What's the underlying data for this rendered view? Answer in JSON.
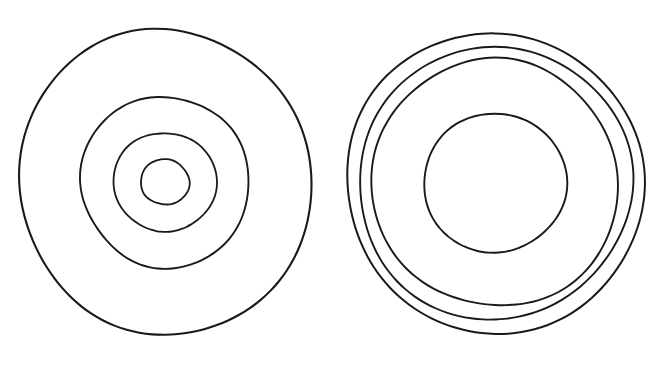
{
  "document": {
    "title": "Concentric Circles Diagram",
    "background_color": "#ffffff",
    "stroke_color": "#1a1a1a",
    "width": 664,
    "height": 376,
    "figure_count": 2,
    "description": "Two hand-drawn concentric-circle targets side by side on a plain white background"
  },
  "chart_data": {
    "type": "diagram",
    "subtype": "concentric-circles",
    "title": "",
    "xlabel": "",
    "ylabel": "",
    "grid": false,
    "legend": false,
    "units": "pixels",
    "figures": [
      {
        "name": "left-figure",
        "label": "Left concentric target",
        "center_x": 165,
        "center_y": 182,
        "ring_count": 4,
        "spacing_style": "evenly-graduated",
        "rings": [
          {
            "index": 1,
            "name": "outer-ring",
            "radius_x": 147,
            "radius_y": 152,
            "stroke_width": 2.1
          },
          {
            "index": 2,
            "name": "second-ring",
            "radius_x": 84,
            "radius_y": 86,
            "stroke_width": 1.9
          },
          {
            "index": 3,
            "name": "third-ring",
            "radius_x": 51,
            "radius_y": 50,
            "stroke_width": 1.8
          },
          {
            "index": 4,
            "name": "inner-ring",
            "radius_x": 24,
            "radius_y": 23,
            "stroke_width": 1.8
          }
        ]
      },
      {
        "name": "right-figure",
        "label": "Right concentric target",
        "center_x": 495,
        "center_y": 183,
        "ring_count": 4,
        "spacing_style": "three-tight-outer-plus-large-inner",
        "rings": [
          {
            "index": 1,
            "name": "outer-ring",
            "radius_x": 150,
            "radius_y": 149,
            "stroke_width": 2.0
          },
          {
            "index": 2,
            "name": "second-ring",
            "radius_x": 137,
            "radius_y": 136,
            "stroke_width": 1.9
          },
          {
            "index": 3,
            "name": "third-ring",
            "radius_x": 124,
            "radius_y": 123,
            "stroke_width": 1.9
          },
          {
            "index": 4,
            "name": "inner-ring",
            "radius_x": 71,
            "radius_y": 70,
            "stroke_width": 1.9
          }
        ]
      }
    ]
  }
}
